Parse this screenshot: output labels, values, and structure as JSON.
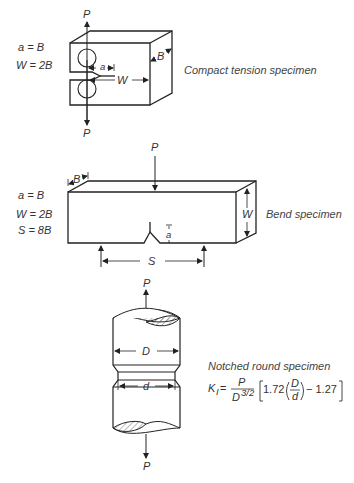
{
  "compact_tension": {
    "title": "Compact tension specimen",
    "eq1": "a = B",
    "eq2": "W = 2B",
    "load_top": "P",
    "load_bottom": "P",
    "dim_a": "a",
    "dim_W": "W",
    "dim_B": "B"
  },
  "bend": {
    "title": "Bend specimen",
    "eq1": "a = B",
    "eq2": "W = 2B",
    "eq3": "S = 8B",
    "load_top": "P",
    "dim_B": "B",
    "dim_W": "W",
    "dim_a": "a",
    "dim_S": "S"
  },
  "notched_round": {
    "title": "Notched round specimen",
    "load_top": "P",
    "load_bottom": "P",
    "dim_D": "D",
    "dim_d": "d",
    "formula": {
      "lhs": "K",
      "lhs_sub": "I",
      "eq": "=",
      "num": "P",
      "den": "D",
      "den_exp": "3/2",
      "coef": "1.72",
      "frac_num": "D",
      "frac_den": "d",
      "minus_const": "− 1.27"
    }
  }
}
